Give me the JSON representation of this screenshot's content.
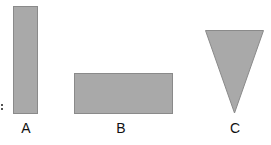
{
  "diagram": {
    "fill_color": "#a9a9a9",
    "stroke_color": "#8a8a8a",
    "shapes": [
      {
        "id": "A",
        "label": "A",
        "type": "tall-rectangle"
      },
      {
        "id": "B",
        "label": "B",
        "type": "wide-rectangle"
      },
      {
        "id": "C",
        "label": "C",
        "type": "inverted-triangle"
      }
    ]
  }
}
